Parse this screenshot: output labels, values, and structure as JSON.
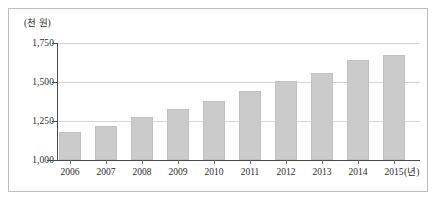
{
  "chart_data": {
    "type": "bar",
    "title": "",
    "subtitle": "",
    "xlabel": "(년)",
    "ylabel": "(천 원)",
    "categories": [
      "2006",
      "2007",
      "2008",
      "2009",
      "2010",
      "2011",
      "2012",
      "2013",
      "2014",
      "2015"
    ],
    "values": [
      1180,
      1215,
      1275,
      1330,
      1380,
      1440,
      1505,
      1560,
      1640,
      1675
    ],
    "ylim": [
      1000,
      1750
    ],
    "ytick_labels": [
      "1,750",
      "1,500",
      "1,250",
      "1,000"
    ],
    "ytick_values": [
      1750,
      1500,
      1250,
      1000
    ],
    "grid": true,
    "legend": false,
    "bar_color": "#cbcbcb",
    "grid_color": "#d4d4d4",
    "axis_color": "#4a4a4a"
  }
}
